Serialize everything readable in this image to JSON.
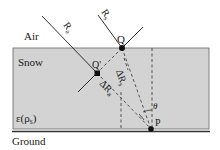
{
  "labels": {
    "air": "Air",
    "snow": "Snow",
    "ground": "Ground",
    "permittivity": "ε(ρs)",
    "permittivity_main": "ε(ρ",
    "permittivity_sub": "s",
    "permittivity_close": ")",
    "ray_a": "R",
    "ray_a_sub": "a",
    "ray_s": "R",
    "ray_s_sub": "s",
    "point_q": "Q",
    "point_q_prime": "Q'",
    "point_p": "P",
    "delta_rs": "ΔR",
    "delta_rs_sub": "s",
    "delta_ra": "ΔR",
    "delta_ra_sub": "a",
    "angle": "θ"
  },
  "colors": {
    "snow_fill": "#d3d3d3",
    "snow_border": "#555555",
    "ground_line": "#333333",
    "ink": "#1a1a1a"
  }
}
